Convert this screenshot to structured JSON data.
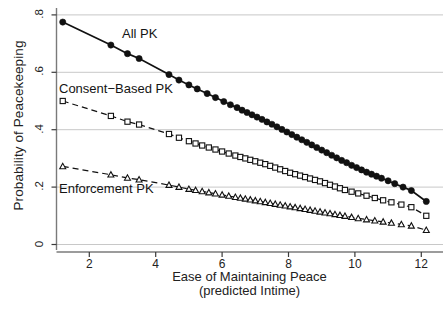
{
  "figure": {
    "width": 443,
    "height": 311,
    "background": "#ffffff",
    "ink_color": "#1a1a1a",
    "grid_color": "#c8c8c8"
  },
  "axis_titles": {
    "y": "Probability of Peacekeeping",
    "x_line1": "Ease of Maintaining Peace",
    "x_line2": "(predicted Intime)"
  },
  "series_labels": {
    "all_pk": "All PK",
    "consent_based_pk": "Consent−Based PK",
    "enforcement_pk": "Enforcement PK"
  },
  "caption_partial": "",
  "chart_data": {
    "type": "line",
    "title": "",
    "xlabel": "Ease of Maintaining Peace (predicted Intime)",
    "ylabel": "Probability of Peacekeeping",
    "xlim": [
      1.0,
      12.4
    ],
    "ylim": [
      0.0,
      0.8
    ],
    "xticks": [
      2,
      4,
      6,
      8,
      10,
      12
    ],
    "xtick_labels": [
      "2",
      "4",
      "6",
      "8",
      "10",
      "12"
    ],
    "yticks": [
      0,
      0.2,
      0.4,
      0.6,
      0.8
    ],
    "ytick_labels": [
      "0",
      ".2",
      ".4",
      ".6",
      ".8"
    ],
    "grid": "horizontal",
    "legend_position": "inline-annotations",
    "series": [
      {
        "name": "All PK",
        "marker": "filled-circle",
        "linestyle": "solid",
        "color": "#111111",
        "points": [
          [
            1.2,
            0.775
          ],
          [
            2.65,
            0.695
          ],
          [
            3.15,
            0.665
          ],
          [
            3.5,
            0.648
          ],
          [
            4.4,
            0.592
          ],
          [
            4.7,
            0.573
          ],
          [
            5.0,
            0.556
          ],
          [
            5.25,
            0.542
          ],
          [
            5.55,
            0.526
          ],
          [
            5.8,
            0.512
          ],
          [
            6.05,
            0.498
          ],
          [
            6.25,
            0.487
          ],
          [
            6.45,
            0.477
          ],
          [
            6.6,
            0.468
          ],
          [
            6.75,
            0.46
          ],
          [
            6.9,
            0.452
          ],
          [
            7.05,
            0.444
          ],
          [
            7.2,
            0.436
          ],
          [
            7.35,
            0.427
          ],
          [
            7.5,
            0.419
          ],
          [
            7.65,
            0.41
          ],
          [
            7.8,
            0.401
          ],
          [
            7.95,
            0.392
          ],
          [
            8.1,
            0.383
          ],
          [
            8.25,
            0.374
          ],
          [
            8.4,
            0.365
          ],
          [
            8.55,
            0.356
          ],
          [
            8.7,
            0.347
          ],
          [
            8.85,
            0.338
          ],
          [
            9.0,
            0.329
          ],
          [
            9.15,
            0.32
          ],
          [
            9.3,
            0.311
          ],
          [
            9.45,
            0.302
          ],
          [
            9.6,
            0.293
          ],
          [
            9.75,
            0.285
          ],
          [
            9.9,
            0.276
          ],
          [
            10.05,
            0.268
          ],
          [
            10.2,
            0.26
          ],
          [
            10.35,
            0.252
          ],
          [
            10.5,
            0.245
          ],
          [
            10.65,
            0.238
          ],
          [
            10.8,
            0.231
          ],
          [
            11.0,
            0.222
          ],
          [
            11.2,
            0.212
          ],
          [
            11.45,
            0.2
          ],
          [
            11.7,
            0.188
          ],
          [
            12.15,
            0.15
          ]
        ]
      },
      {
        "name": "Consent−Based PK",
        "marker": "open-square",
        "linestyle": "dashed",
        "color": "#111111",
        "points": [
          [
            1.2,
            0.5
          ],
          [
            2.65,
            0.448
          ],
          [
            3.15,
            0.428
          ],
          [
            3.5,
            0.418
          ],
          [
            4.4,
            0.385
          ],
          [
            4.7,
            0.372
          ],
          [
            5.0,
            0.36
          ],
          [
            5.2,
            0.352
          ],
          [
            5.4,
            0.345
          ],
          [
            5.6,
            0.338
          ],
          [
            5.8,
            0.331
          ],
          [
            6.0,
            0.324
          ],
          [
            6.2,
            0.317
          ],
          [
            6.4,
            0.31
          ],
          [
            6.55,
            0.305
          ],
          [
            6.7,
            0.3
          ],
          [
            6.85,
            0.295
          ],
          [
            7.0,
            0.29
          ],
          [
            7.15,
            0.285
          ],
          [
            7.3,
            0.28
          ],
          [
            7.45,
            0.274
          ],
          [
            7.6,
            0.268
          ],
          [
            7.75,
            0.262
          ],
          [
            7.9,
            0.256
          ],
          [
            8.05,
            0.25
          ],
          [
            8.2,
            0.245
          ],
          [
            8.35,
            0.24
          ],
          [
            8.5,
            0.235
          ],
          [
            8.65,
            0.23
          ],
          [
            8.8,
            0.225
          ],
          [
            8.95,
            0.22
          ],
          [
            9.1,
            0.214
          ],
          [
            9.25,
            0.208
          ],
          [
            9.4,
            0.202
          ],
          [
            9.55,
            0.196
          ],
          [
            9.7,
            0.19
          ],
          [
            9.9,
            0.184
          ],
          [
            10.1,
            0.178
          ],
          [
            10.35,
            0.17
          ],
          [
            10.6,
            0.162
          ],
          [
            10.85,
            0.154
          ],
          [
            11.1,
            0.147
          ],
          [
            11.4,
            0.139
          ],
          [
            11.7,
            0.13
          ],
          [
            12.15,
            0.1
          ]
        ]
      },
      {
        "name": "Enforcement PK",
        "marker": "open-triangle",
        "linestyle": "dashed",
        "color": "#111111",
        "points": [
          [
            1.2,
            0.272
          ],
          [
            2.65,
            0.243
          ],
          [
            3.15,
            0.232
          ],
          [
            3.5,
            0.226
          ],
          [
            4.4,
            0.207
          ],
          [
            4.7,
            0.2
          ],
          [
            5.0,
            0.193
          ],
          [
            5.2,
            0.189
          ],
          [
            5.4,
            0.185
          ],
          [
            5.6,
            0.181
          ],
          [
            5.8,
            0.177
          ],
          [
            6.0,
            0.173
          ],
          [
            6.2,
            0.169
          ],
          [
            6.4,
            0.165
          ],
          [
            6.55,
            0.162
          ],
          [
            6.7,
            0.159
          ],
          [
            6.85,
            0.156
          ],
          [
            7.0,
            0.153
          ],
          [
            7.15,
            0.15
          ],
          [
            7.3,
            0.147
          ],
          [
            7.45,
            0.144
          ],
          [
            7.6,
            0.141
          ],
          [
            7.75,
            0.138
          ],
          [
            7.9,
            0.135
          ],
          [
            8.05,
            0.132
          ],
          [
            8.2,
            0.129
          ],
          [
            8.35,
            0.126
          ],
          [
            8.5,
            0.123
          ],
          [
            8.65,
            0.12
          ],
          [
            8.8,
            0.117
          ],
          [
            8.95,
            0.114
          ],
          [
            9.1,
            0.111
          ],
          [
            9.25,
            0.108
          ],
          [
            9.4,
            0.105
          ],
          [
            9.55,
            0.102
          ],
          [
            9.7,
            0.099
          ],
          [
            9.9,
            0.095
          ],
          [
            10.1,
            0.091
          ],
          [
            10.35,
            0.087
          ],
          [
            10.6,
            0.083
          ],
          [
            10.85,
            0.079
          ],
          [
            11.1,
            0.075
          ],
          [
            11.4,
            0.07
          ],
          [
            11.7,
            0.065
          ],
          [
            12.15,
            0.05
          ]
        ]
      }
    ]
  }
}
